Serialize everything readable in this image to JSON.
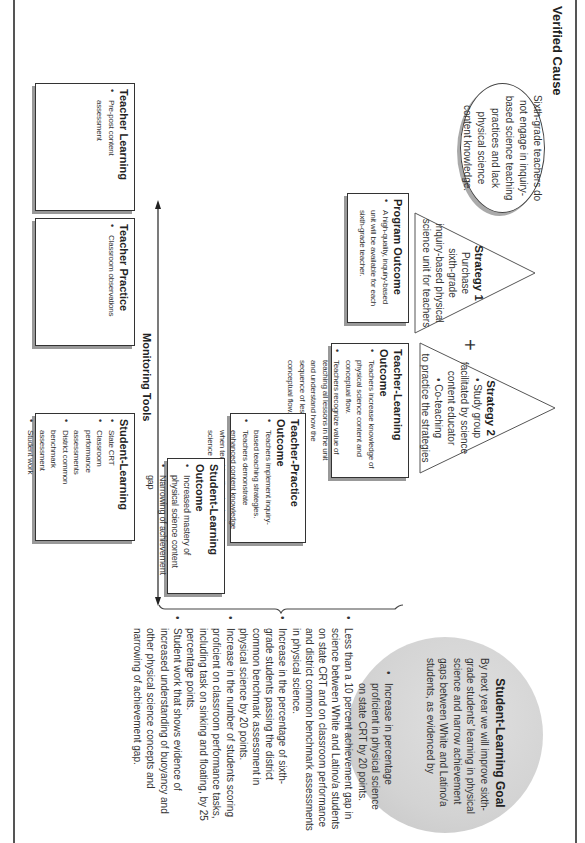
{
  "verified_cause": {
    "heading": "Verified Cause",
    "text": "Sixth-grade teachers do not engage in inquiry-based science teaching practices and lack physical science content knowledge."
  },
  "strategies": [
    {
      "title": "Strategy 1",
      "lines": [
        "Purchase",
        "sixth-grade",
        "inquiry-based physical",
        "science unit for teachers"
      ]
    },
    {
      "title": "Strategy 2",
      "lines": [
        "• Study group",
        "facilitated by science",
        "content educator",
        "• Co-teaching",
        "to practice the strategies"
      ]
    }
  ],
  "plus_sign": "+",
  "outcomes": {
    "program": {
      "title": "Program Outcome",
      "items": [
        "A high-quality, inquiry-based unit will be available for each sixth-grade teacher."
      ]
    },
    "teacher_learning": {
      "title": "Teacher-Learning Outcome",
      "items": [
        "Teachers increase knowledge of physical science content and conceptual flow.",
        "Teachers recognize value of teaching all lessons in the unit and understand how the sequence of lessons reflects the conceptual flow."
      ]
    },
    "teacher_practice": {
      "title": "Teacher-Practice Outcome",
      "items": [
        "Teachers implement inquiry-based teaching strategies.",
        "Teachers demonstrate enhanced content knowledge when teaching the physical science unit."
      ]
    },
    "student_learning": {
      "title": "Student-Learning Outcome",
      "items": [
        "Increased mastery of physical science content",
        "Narrowing of achievement gap"
      ]
    }
  },
  "monitoring_tools": {
    "label": "Monitoring Tools",
    "boxes": [
      {
        "title": "Teacher Learning",
        "items": [
          "Pre-post content assessment"
        ]
      },
      {
        "title": "Teacher Practice",
        "items": [
          "Classroom observations"
        ]
      },
      {
        "title": "Student-Learning",
        "items": [
          "State CRT",
          "Classroom performance assessments",
          "District common benchmark assessment",
          "Student work"
        ]
      }
    ]
  },
  "goal": {
    "title": "Student-Learning Goal",
    "intro": "By next year we will improve sixth-grade students' learning in physical science and narrow achievement gaps between White and Latino/a students, as evidenced by",
    "items": [
      "Increase in percentage proficient in physical science on state CRT by 20 points.",
      "Less than a 10 percent achievement gap in science between White and Latino/a students on state CRT and on classroom performance and district common benchmark assessments in physical science.",
      "Increase in the percentage of sixth-grade students passing the district common benchmark assessment in physical science by 20 points.",
      "Increase in the number of students scoring proficient on classroom performance tasks, including task on sinking and floating, by 25 percentage points.",
      "Student work that shows evidence of increased understanding of buoyancy and other physical science concepts and narrowing of achievement gap."
    ]
  },
  "colors": {
    "goal_fill": "#d3d3d3",
    "line": "#444444",
    "shadow": "#999999"
  }
}
